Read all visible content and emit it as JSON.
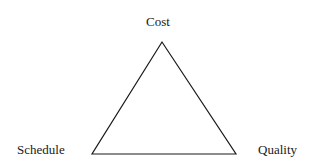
{
  "diagram": {
    "type": "triangle",
    "title": "",
    "vertices": {
      "top": {
        "label": "Cost"
      },
      "bottom_left": {
        "label": "Schedule"
      },
      "bottom_right": {
        "label": "Quality"
      }
    },
    "stroke_color": "#1a1a1a",
    "background": "#ffffff"
  }
}
